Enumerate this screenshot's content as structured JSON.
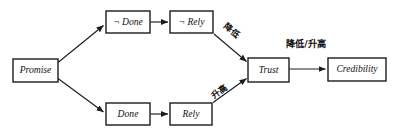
{
  "diagram": {
    "type": "flowchart",
    "background": "#ffffff",
    "line_color": "#1c1c1c",
    "text_color": "#111111",
    "nodes": [
      {
        "id": "promise",
        "label": "Promise",
        "x": 13,
        "y": 59,
        "w": 45,
        "h": 23
      },
      {
        "id": "not-done",
        "label": "¬ Done",
        "x": 106,
        "y": 11,
        "w": 44,
        "h": 22
      },
      {
        "id": "not-rely",
        "label": "¬ Rely",
        "x": 170,
        "y": 11,
        "w": 43,
        "h": 22
      },
      {
        "id": "done",
        "label": "Done",
        "x": 106,
        "y": 103,
        "w": 44,
        "h": 22
      },
      {
        "id": "rely",
        "label": "Rely",
        "x": 170,
        "y": 103,
        "w": 42,
        "h": 22
      },
      {
        "id": "trust",
        "label": "Trust",
        "x": 248,
        "y": 58,
        "w": 41,
        "h": 24
      },
      {
        "id": "credibility",
        "label": "Credibility",
        "x": 328,
        "y": 58,
        "w": 58,
        "h": 23
      }
    ],
    "edges": [
      {
        "id": "promise-to-not-done",
        "from": "promise",
        "to": "not-done",
        "label": ""
      },
      {
        "id": "promise-to-done",
        "from": "promise",
        "to": "done",
        "label": ""
      },
      {
        "id": "not-done-to-not-rely",
        "from": "not-done",
        "to": "not-rely",
        "label": ""
      },
      {
        "id": "done-to-rely",
        "from": "done",
        "to": "rely",
        "label": ""
      },
      {
        "id": "not-rely-to-trust",
        "from": "not-rely",
        "to": "trust",
        "label": "降低"
      },
      {
        "id": "rely-to-trust",
        "from": "rely",
        "to": "trust",
        "label": "升高"
      },
      {
        "id": "trust-to-credibility",
        "from": "trust",
        "to": "credibility",
        "label": "降低/升高"
      }
    ],
    "edge_labels": {
      "not_rely_to_trust": "降低",
      "rely_to_trust": "升高",
      "trust_to_credibility": "降低/升高"
    }
  }
}
